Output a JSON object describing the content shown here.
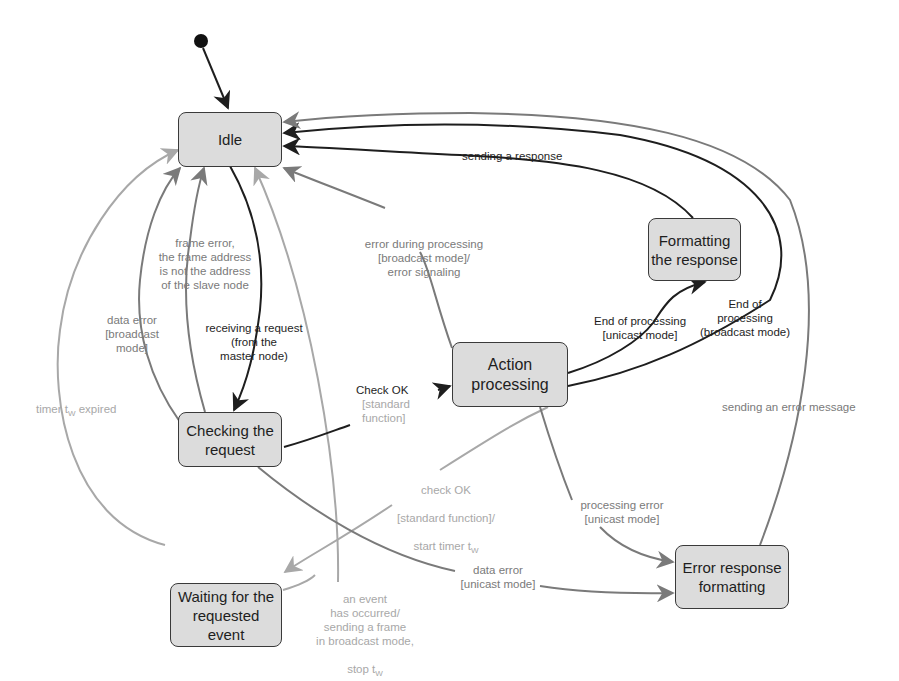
{
  "diagram": {
    "type": "UML state machine (slave node request handling)",
    "colors": {
      "state_fill": "#dcdcdc",
      "state_border": "#3a3a3a",
      "edge_dark": "#1e1e1e",
      "edge_mid": "#7a7a7a",
      "edge_light": "#a8a8a8"
    },
    "initial_state_icon": "filled-circle",
    "states": {
      "idle": "Idle",
      "formatting": "Formatting\nthe response",
      "action": "Action\nprocessing",
      "checking": "Checking the\nrequest",
      "waiting": "Waiting for the\nrequested\nevent",
      "error_resp": "Error response\nformatting"
    },
    "transitions": {
      "sending_response": "sending a response",
      "error_processing_broadcast": "error during processing\n[broadcast mode]/\nerror signaling",
      "frame_error": "frame error,\nthe frame address\nis not the address\nof the slave node",
      "data_error_broadcast": "data error\n[broadcast\nmode]",
      "receiving_request": "receiving a request\n(from the\nmaster node)",
      "timer_expired_prefix": "timer t",
      "timer_expired_sub": "W",
      "timer_expired_suffix": " expired",
      "check_ok": "Check OK",
      "check_ok_guard": "[standard\nfunction]",
      "end_unicast": "End of processing\n[unicast mode]",
      "end_broadcast": "End of\nprocessing\n(broadcast mode)",
      "sending_error_message": "sending an error message",
      "check_ok_timer_line1": "check OK",
      "check_ok_timer_line2": "[standard function]/",
      "check_ok_timer_line3_prefix": "start timer t",
      "check_ok_timer_sub": "W",
      "processing_error_unicast": "processing error\n[unicast mode]",
      "data_error_unicast": "data error\n[unicast mode]",
      "event_occurred_lines": "an event\nhas occurred/\nsending a frame\nin broadcast mode,",
      "event_stop_prefix": "stop t",
      "event_stop_sub": "W"
    }
  }
}
